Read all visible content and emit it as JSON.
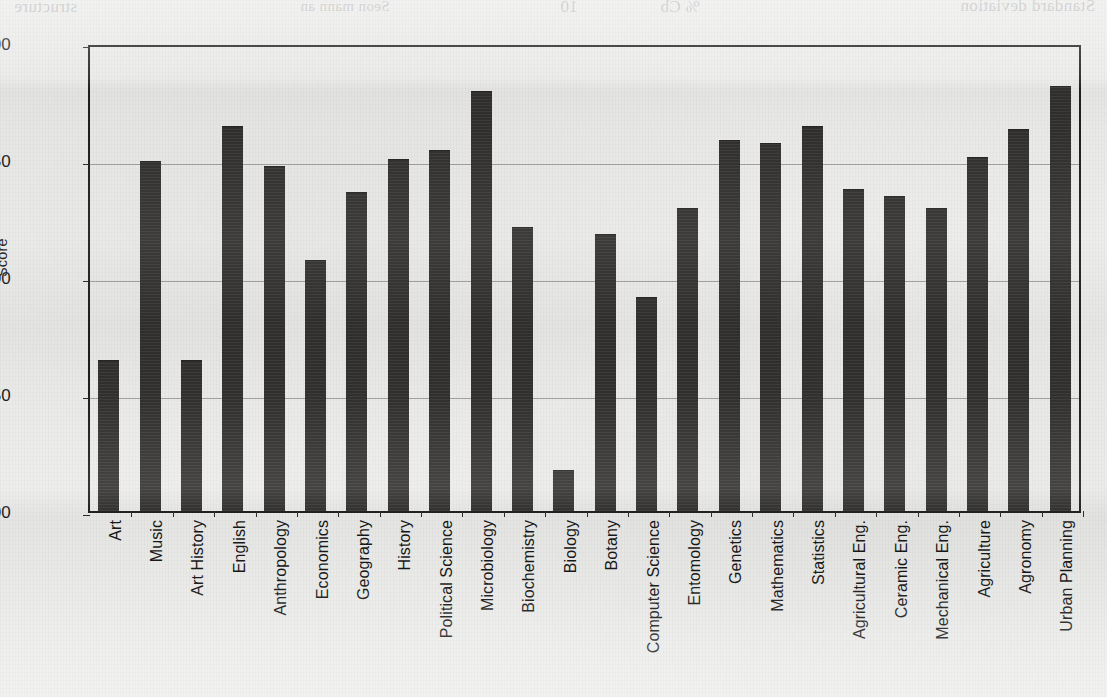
{
  "figure": {
    "axis_title_y": "Score",
    "bar_color": "#333230",
    "frame_color": "#1f1f1f",
    "paper_color": "#ececeb"
  },
  "bleed_through": {
    "fragment_1": "structure",
    "fragment_2": "Seon mann an",
    "fragment_3": "10",
    "fragment_4": "% Cb",
    "fragment_5": "Standard deviation"
  },
  "chart_data": {
    "type": "bar",
    "title": "",
    "xlabel": "",
    "ylabel": "Score",
    "ylim": [
      3.0,
      5.0
    ],
    "yticks": [
      3.0,
      3.5,
      4.0,
      4.5,
      5.0
    ],
    "ytick_labels": [
      "3.00",
      "3.50",
      "4.00",
      "4.50",
      "5.00"
    ],
    "grid": true,
    "legend": "none",
    "categories": [
      "Art",
      "Music",
      "Art History",
      "English",
      "Anthropology",
      "Economics",
      "Geography",
      "History",
      "Political  Science",
      "Microbiology",
      "Biochemistry",
      "Biology",
      "Botany",
      "Computer Science",
      "Entomology",
      "Genetics",
      "Mathematics",
      "Statistics",
      "Agricultural Eng.",
      "Ceramic Eng.",
      "Mechanical Eng.",
      "Agriculture",
      "Agronomy",
      "Urban Planning"
    ],
    "values": [
      3.64,
      4.49,
      3.64,
      4.64,
      4.47,
      4.07,
      4.36,
      4.5,
      4.54,
      4.79,
      4.21,
      3.17,
      4.18,
      3.91,
      4.29,
      4.58,
      4.57,
      4.64,
      4.37,
      4.34,
      4.29,
      4.51,
      4.63,
      4.81
    ]
  }
}
